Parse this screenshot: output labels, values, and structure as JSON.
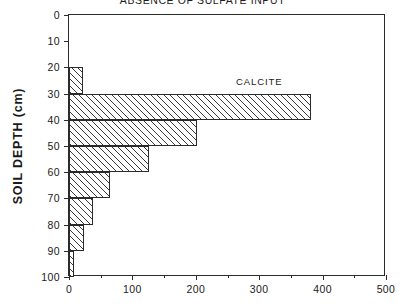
{
  "chart_data": {
    "type": "bar",
    "orientation": "horizontal",
    "title": "ABSENCE OF SULFATE INPUT",
    "xlabel": "",
    "ylabel": "SOIL DEPTH (cm)",
    "xlim": [
      0,
      500
    ],
    "ylim": [
      0,
      100
    ],
    "y_inverted": true,
    "grid": false,
    "legend_position": "inside-top-right",
    "xticks": [
      0,
      100,
      200,
      300,
      400,
      500
    ],
    "xtick_labels": [
      "0",
      "100",
      "200",
      "300",
      "400",
      "500"
    ],
    "x_minor_ticks": [
      50,
      150,
      250,
      350,
      450
    ],
    "yticks": [
      0,
      10,
      20,
      30,
      40,
      50,
      60,
      70,
      80,
      90,
      100
    ],
    "ytick_labels": [
      "0",
      "10",
      "20",
      "30",
      "40",
      "50",
      "60",
      "70",
      "80",
      "90",
      "100"
    ],
    "annotations": [
      {
        "text": "CALCITE",
        "x": 300,
        "y": 25
      }
    ],
    "series": [
      {
        "name": "CALCITE",
        "bin_edges": [
          0,
          10,
          20,
          30,
          40,
          50,
          60,
          70,
          80,
          90,
          100
        ],
        "bin_labels": [
          "0-10",
          "10-20",
          "20-30",
          "30-40",
          "40-50",
          "50-60",
          "60-70",
          "70-80",
          "80-90",
          "90-100"
        ],
        "values": [
          0,
          0,
          22,
          382,
          202,
          126,
          65,
          38,
          23,
          8
        ]
      }
    ]
  },
  "axis": {
    "y_title": "SOIL  DEPTH  (cm)"
  },
  "figure": {
    "title": "ABSENCE OF SULFATE INPUT"
  }
}
